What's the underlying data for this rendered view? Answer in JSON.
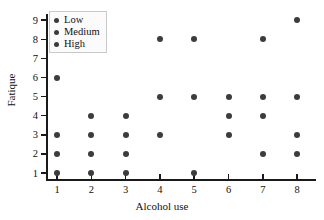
{
  "chart_data": {
    "type": "scatter",
    "title": "",
    "xlabel": "Alcohol use",
    "ylabel": "Fatique",
    "xlim": [
      0.5,
      8.8
    ],
    "ylim": [
      0.4,
      9.6
    ],
    "xticks": [
      "1",
      "2",
      "3",
      "4",
      "5",
      "6",
      "7",
      "8"
    ],
    "yticks": [
      "1",
      "2",
      "3",
      "4",
      "5",
      "6",
      "7",
      "8",
      "9"
    ],
    "grid": false,
    "legend_position": "top-left",
    "marker_color": "#3c3c40",
    "axis_color": "#1a1a1a",
    "legend": [
      {
        "label": "Low",
        "color": "#3c3c40"
      },
      {
        "label": "Medium",
        "color": "#3c3c40"
      },
      {
        "label": "High",
        "color": "#3c3c40"
      }
    ],
    "points": [
      {
        "x": 1,
        "y": 6
      },
      {
        "x": 1,
        "y": 3
      },
      {
        "x": 1,
        "y": 2
      },
      {
        "x": 1,
        "y": 1
      },
      {
        "x": 2,
        "y": 4
      },
      {
        "x": 2,
        "y": 3
      },
      {
        "x": 2,
        "y": 2
      },
      {
        "x": 2,
        "y": 1
      },
      {
        "x": 3,
        "y": 4
      },
      {
        "x": 3,
        "y": 3
      },
      {
        "x": 3,
        "y": 2
      },
      {
        "x": 3,
        "y": 1
      },
      {
        "x": 4,
        "y": 8
      },
      {
        "x": 4,
        "y": 5
      },
      {
        "x": 4,
        "y": 3
      },
      {
        "x": 5,
        "y": 8
      },
      {
        "x": 5,
        "y": 5
      },
      {
        "x": 5,
        "y": 1
      },
      {
        "x": 6,
        "y": 5
      },
      {
        "x": 6,
        "y": 4
      },
      {
        "x": 6,
        "y": 3
      },
      {
        "x": 7,
        "y": 8
      },
      {
        "x": 7,
        "y": 5
      },
      {
        "x": 7,
        "y": 4
      },
      {
        "x": 7,
        "y": 2
      },
      {
        "x": 8,
        "y": 9
      },
      {
        "x": 8,
        "y": 5
      },
      {
        "x": 8,
        "y": 3
      },
      {
        "x": 8,
        "y": 2
      }
    ]
  }
}
